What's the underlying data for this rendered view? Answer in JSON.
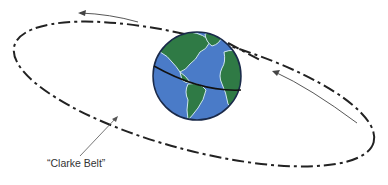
{
  "diagram": {
    "label": "“Clarke Belt”",
    "elements": {
      "orbit": {
        "type": "dashed-ellipse",
        "color": "#222222"
      },
      "earth": {
        "ocean_color": "#4a7bc8",
        "land_color": "#2f7a45",
        "outline_color": "#1a2a4a",
        "equator_color": "#111111"
      },
      "arrows": [
        {
          "name": "top-direction-arrow",
          "direction": "left"
        },
        {
          "name": "right-direction-arrow",
          "direction": "up-left"
        }
      ],
      "leader_line": {
        "from": "label",
        "to": "orbit"
      }
    }
  }
}
